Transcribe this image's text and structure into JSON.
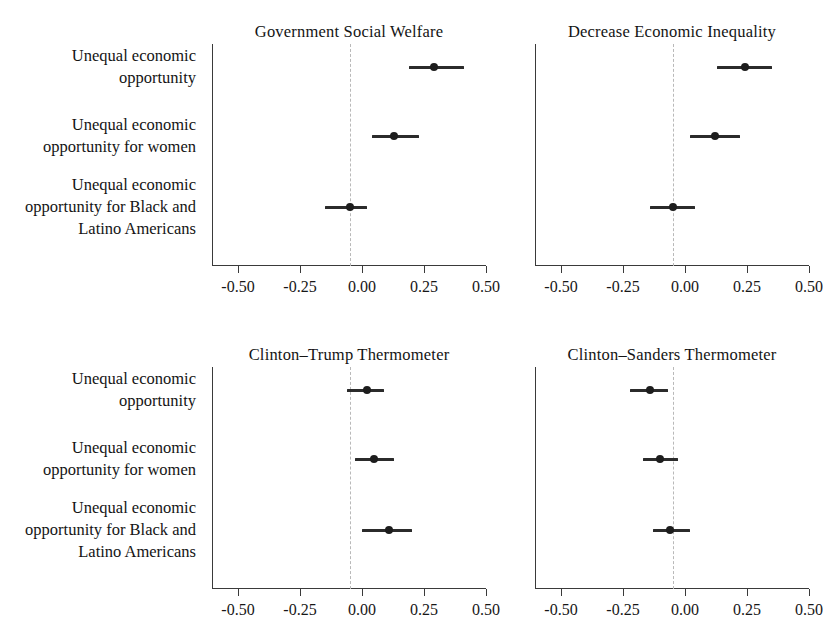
{
  "figure": {
    "background": "#ffffff",
    "point_color": "#1d1d1d",
    "interval_color": "#2b2b2b",
    "refline_color": "#b9b9b9",
    "axis_color": "#3a3a3a"
  },
  "row_labels": [
    "Unequal economic opportunity",
    "Unequal economic opportunity for women",
    "Unequal economic opportunity for Black and Latino Americans"
  ],
  "axis": {
    "ticks": [
      -0.5,
      -0.25,
      0,
      0.25,
      0.5
    ],
    "tick_labels": [
      "-0.50",
      "-0.25",
      "0.00",
      "0.25",
      "0.50"
    ],
    "xlim": [
      -0.62,
      0.56
    ],
    "reference_line": -0.05
  },
  "chart_data": {
    "type": "scatter",
    "title": "",
    "xlabel": "",
    "ylabel": "",
    "grid": false,
    "legend": "none",
    "xlim": [
      -0.62,
      0.56
    ],
    "xticks": [
      -0.5,
      -0.25,
      0,
      0.25,
      0.5
    ],
    "xticklabels": [
      "-0.50",
      "-0.25",
      "0.00",
      "0.25",
      "0.50"
    ],
    "reference_line": -0.05,
    "categories": [
      "Unequal economic opportunity",
      "Unequal economic opportunity for women",
      "Unequal economic opportunity for Black and Latino Americans"
    ],
    "panels": [
      {
        "title": "Government Social Welfare",
        "estimates": [
          0.29,
          0.13,
          -0.05
        ],
        "ci_low": [
          0.19,
          0.04,
          -0.15
        ],
        "ci_high": [
          0.41,
          0.23,
          0.02
        ]
      },
      {
        "title": "Decrease Economic Inequality",
        "estimates": [
          0.24,
          0.12,
          -0.05
        ],
        "ci_low": [
          0.13,
          0.02,
          -0.14
        ],
        "ci_high": [
          0.35,
          0.22,
          0.04
        ]
      },
      {
        "title": "Clinton–Trump Thermometer",
        "estimates": [
          0.02,
          0.05,
          0.11
        ],
        "ci_low": [
          -0.06,
          -0.03,
          0.0
        ],
        "ci_high": [
          0.09,
          0.13,
          0.2
        ]
      },
      {
        "title": "Clinton–Sanders Thermometer",
        "estimates": [
          -0.14,
          -0.1,
          -0.06
        ],
        "ci_low": [
          -0.22,
          -0.17,
          -0.13
        ],
        "ci_high": [
          -0.07,
          -0.03,
          0.02
        ]
      }
    ]
  }
}
